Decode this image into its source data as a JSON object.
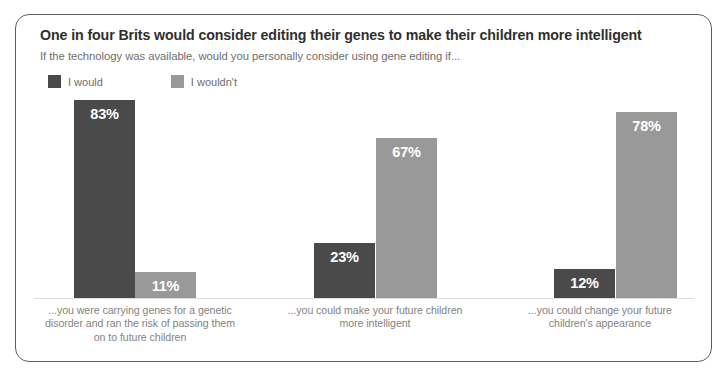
{
  "card": {
    "title": "One in four Brits would consider editing their genes to make their children more intelligent",
    "subtitle": "If the technology was available, would you personally consider using gene editing if..."
  },
  "legend": {
    "items": [
      {
        "label": "I would",
        "color": "#4a4a4a",
        "swatch_name": "legend-swatch-i-would"
      },
      {
        "label": "I wouldn't",
        "color": "#999999",
        "swatch_name": "legend-swatch-i-wouldnt"
      }
    ]
  },
  "chart_data": {
    "type": "bar",
    "title": "One in four Brits would consider editing their genes to make their children more intelligent",
    "subtitle": "If the technology was available, would you personally consider using gene editing if...",
    "xlabel": "",
    "ylabel": "",
    "ylim": [
      0,
      100
    ],
    "grid": false,
    "legend_position": "top-left",
    "categories": [
      "...you were carrying genes for a genetic disorder and ran the risk of passing them on to future children",
      "...you could make your future children more intelligent",
      "...you could change your future children's appearance"
    ],
    "category_lines": [
      [
        "...you were carrying genes for a genetic",
        "disorder and ran the risk of passing them",
        "on to future children"
      ],
      [
        "...you could make your future children",
        "more intelligent"
      ],
      [
        "...you could change your future",
        "children's appearance"
      ]
    ],
    "series": [
      {
        "name": "I would",
        "color": "#4a4a4a",
        "values": [
          83,
          23,
          12
        ],
        "labels": [
          "83%",
          "23%",
          "12%"
        ]
      },
      {
        "name": "I wouldn't",
        "color": "#999999",
        "values": [
          11,
          67,
          78
        ],
        "labels": [
          "11%",
          "67%",
          "78%"
        ]
      }
    ]
  },
  "geometry": {
    "baseline_y": 283,
    "px_per_percent": 2.385,
    "bar_width": 61,
    "bars": [
      {
        "x": 58,
        "series": 0,
        "group": 0
      },
      {
        "x": 119,
        "series": 1,
        "group": 0
      },
      {
        "x": 298,
        "series": 0,
        "group": 1
      },
      {
        "x": 360,
        "series": 1,
        "group": 1
      },
      {
        "x": 538,
        "series": 0,
        "group": 2
      },
      {
        "x": 600,
        "series": 1,
        "group": 2
      }
    ],
    "group_label_boxes": [
      {
        "left": 8,
        "width": 232,
        "top": 289
      },
      {
        "left": 248,
        "width": 222,
        "top": 289
      },
      {
        "left": 478,
        "width": 212,
        "top": 289
      }
    ]
  }
}
